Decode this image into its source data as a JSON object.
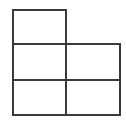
{
  "diagram": {
    "type": "grid-shape",
    "stroke_color": "#3a3a3a",
    "fill_color": "#ffffff",
    "cells": [
      {
        "row": 0,
        "col": 0,
        "x": 12,
        "y": 9,
        "w": 55,
        "h": 36
      },
      {
        "row": 1,
        "col": 0,
        "x": 12,
        "y": 43,
        "w": 55,
        "h": 38
      },
      {
        "row": 1,
        "col": 1,
        "x": 65,
        "y": 43,
        "w": 56,
        "h": 38
      },
      {
        "row": 2,
        "col": 0,
        "x": 12,
        "y": 79,
        "w": 55,
        "h": 37
      },
      {
        "row": 2,
        "col": 1,
        "x": 65,
        "y": 79,
        "w": 56,
        "h": 37
      }
    ]
  }
}
